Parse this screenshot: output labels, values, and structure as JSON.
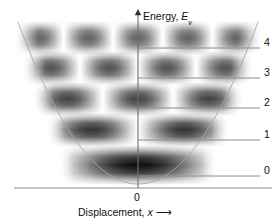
{
  "figure": {
    "kind": "quantum-harmonic-oscillator-diagram",
    "background_color": "#ffffff",
    "axes": {
      "y_axis": {
        "label_text": "Energy,",
        "label_symbol": "E",
        "label_subscript": "v",
        "arrow": "up",
        "x_px": 138,
        "top_px": 9,
        "bottom_px": 188
      },
      "x_axis": {
        "label_text": "Displacement,",
        "label_symbol": "x",
        "arrow_glyph": "⟶",
        "origin_label": "0",
        "y_px": 188,
        "left_px": 14,
        "right_px": 272
      }
    },
    "potential_curve": {
      "type": "parabola",
      "color": "#a8a8a8",
      "stroke_width": 0.9,
      "vertex_x_px": 138,
      "vertex_y_px": 184,
      "left_top_x_px": 18,
      "right_top_x_px": 258,
      "top_y_px": 22
    },
    "level_line": {
      "color": "#8c8c8c",
      "stroke_width": 1.0,
      "right_end_px": 260
    },
    "bands": {
      "color": "#000000",
      "description": "grayscale probability density bands; lobe count equals v + 1"
    },
    "levels": [
      {
        "label": "4",
        "quantum_number": 4,
        "line_y_px": 48,
        "band_center_y_px": 38,
        "band_height_px": 17,
        "band_left_px": 14,
        "band_right_px": 262,
        "lobes": 5,
        "peak_opacity": 0.62
      },
      {
        "label": "3",
        "quantum_number": 3,
        "line_y_px": 78,
        "band_center_y_px": 68,
        "band_height_px": 17,
        "band_left_px": 22,
        "band_right_px": 254,
        "lobes": 4,
        "peak_opacity": 0.68
      },
      {
        "label": "2",
        "quantum_number": 2,
        "line_y_px": 108,
        "band_center_y_px": 99,
        "band_height_px": 17,
        "band_left_px": 32,
        "band_right_px": 244,
        "lobes": 3,
        "peak_opacity": 0.74
      },
      {
        "label": "1",
        "quantum_number": 1,
        "line_y_px": 140,
        "band_center_y_px": 130,
        "band_height_px": 17,
        "band_left_px": 46,
        "band_right_px": 230,
        "lobes": 2,
        "peak_opacity": 0.8
      },
      {
        "label": "0",
        "quantum_number": 0,
        "line_y_px": 176,
        "band_center_y_px": 165,
        "band_height_px": 20,
        "band_left_px": 58,
        "band_right_px": 218,
        "lobes": 1,
        "peak_opacity": 0.95
      }
    ]
  }
}
